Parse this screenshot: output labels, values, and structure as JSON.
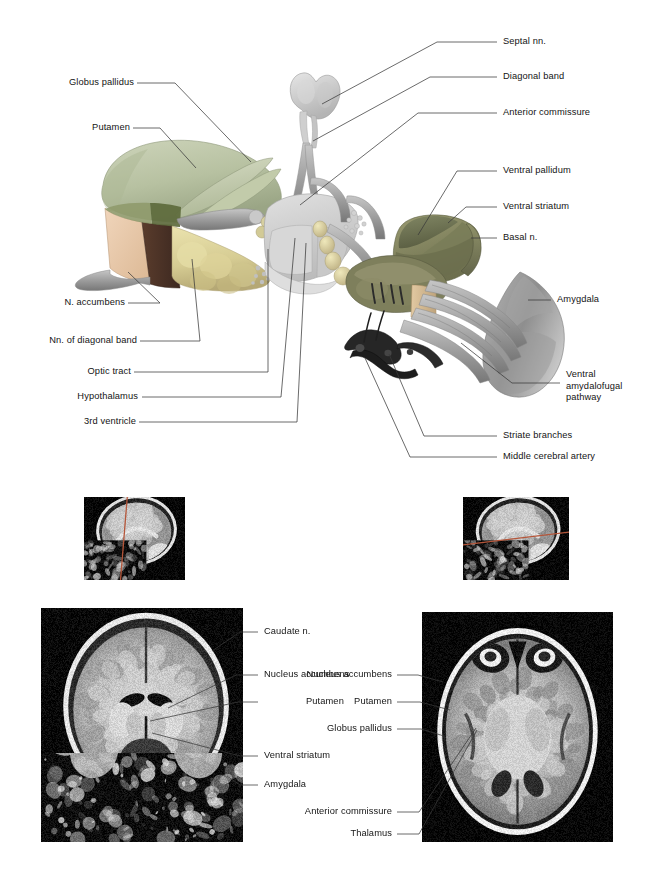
{
  "figure": {
    "panels": [
      "schematic-overview",
      "sagittal-locator-coronal",
      "sagittal-locator-axial",
      "coronal-mri",
      "axial-mri"
    ]
  },
  "colors": {
    "putamen": "#b9c3a4",
    "globus_pallidus": "#c9d1b6",
    "nucleus_accumbens": "#e8c7a8",
    "cut_face": "#4a3228",
    "diagonal_band_nuclei": "#ded6a0",
    "ventral_pallidum": "#6d7355",
    "ventral_striatum": "#8b8e68",
    "basal_nucleus": "#7d7f5c",
    "amygdala": "#8f8f8f",
    "fiber_tracts": "#a8a8a8",
    "hypothalamus": "#cfcfcf",
    "artery_dark": "#2a2a2a",
    "leader_line": "#3a3a3a",
    "locator_plane": "#b5563a",
    "background": "#ffffff"
  },
  "schematic": {
    "labels_left": [
      {
        "id": "globus-pallidus",
        "text": "Globus pallidus"
      },
      {
        "id": "putamen",
        "text": "Putamen"
      },
      {
        "id": "n-accumbens",
        "text": "N. accumbens"
      },
      {
        "id": "nn-diagonal-band",
        "text": "Nn. of diagonal band"
      },
      {
        "id": "optic-tract",
        "text": "Optic tract"
      },
      {
        "id": "hypothalamus",
        "text": "Hypothalamus"
      },
      {
        "id": "third-ventricle",
        "text": "3rd ventricle"
      }
    ],
    "labels_right": [
      {
        "id": "septal-nn",
        "text": "Septal nn."
      },
      {
        "id": "diagonal-band",
        "text": "Diagonal band"
      },
      {
        "id": "anterior-commissure",
        "text": "Anterior commissure"
      },
      {
        "id": "ventral-pallidum",
        "text": "Ventral pallidum"
      },
      {
        "id": "ventral-striatum",
        "text": "Ventral striatum"
      },
      {
        "id": "basal-n",
        "text": "Basal n."
      },
      {
        "id": "amygdala",
        "text": "Amygdala"
      },
      {
        "id": "ventral-amydalofugal-pathway",
        "text": "Ventral amydalofugal pathway"
      },
      {
        "id": "striate-branches",
        "text": "Striate branches"
      },
      {
        "id": "middle-cerebral-artery",
        "text": "Middle cerebral artery"
      }
    ]
  },
  "mri": {
    "coronal": {
      "view": "coronal",
      "labels": [
        {
          "id": "caudate-n",
          "text": "Caudate n."
        },
        {
          "id": "nucleus-accumbens",
          "text": "Nucleus accumbens"
        },
        {
          "id": "putamen",
          "text": "Putamen"
        },
        {
          "id": "ventral-striatum",
          "text": "Ventral striatum"
        },
        {
          "id": "amygdala",
          "text": "Amygdala"
        }
      ]
    },
    "axial": {
      "view": "axial",
      "labels": [
        {
          "id": "nucleus-accumbens",
          "text": "Nucleus accumbens"
        },
        {
          "id": "putamen",
          "text": "Putamen"
        },
        {
          "id": "globus-pallidus",
          "text": "Globus pallidus"
        },
        {
          "id": "anterior-commissure",
          "text": "Anterior commissure"
        },
        {
          "id": "thalamus",
          "text": "Thalamus"
        }
      ]
    },
    "locators": [
      {
        "id": "locator-coronal",
        "view": "sagittal",
        "plane": "coronal"
      },
      {
        "id": "locator-axial",
        "view": "sagittal",
        "plane": "axial"
      }
    ]
  }
}
